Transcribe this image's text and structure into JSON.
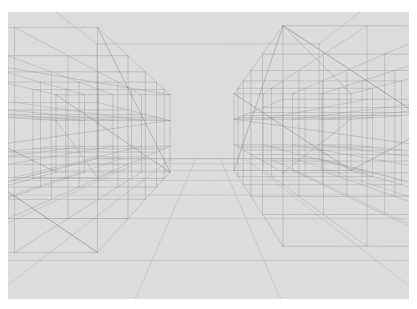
{
  "scene": {
    "title": "3D wireframe perspective interior",
    "type": "line-drawing",
    "canvas": {
      "width": 417,
      "height": 309
    },
    "paper": {
      "margin_left": 8,
      "margin_top": 12,
      "margin_right": 8,
      "margin_bottom": 10,
      "background_color": "#ffffff",
      "plate_color": "#dcdcdc"
    },
    "line_style": {
      "stroke_color": "#8d8d92",
      "stroke_color_faint": "#b2b2b6",
      "stroke_color_strong": "#75757b",
      "stroke_width_main": 0.6,
      "stroke_width_detail": 0.45
    },
    "camera": {
      "vanishing_point_x": 208,
      "vanishing_point_y": 130,
      "focal_length": 300,
      "eye_height": 1.55,
      "projection": "one-point-perspective"
    },
    "room": {
      "label": "enclosing room volume",
      "width": 12.0,
      "height": 6.2,
      "depth": 14.0,
      "back_wall_visible": true,
      "ceiling_visible": true,
      "floor_visible": true
    },
    "structures": [
      {
        "name": "left-block-lattice",
        "label": "Left cube lattice",
        "origin": [
          -5.6,
          0.0,
          1.6
        ],
        "cells": [
          4,
          3,
          5
        ],
        "cell_size": [
          1.05,
          0.95,
          1.45
        ]
      },
      {
        "name": "right-block-lattice",
        "label": "Right cube lattice",
        "origin": [
          1.0,
          0.0,
          1.8
        ],
        "cells": [
          4,
          3,
          5
        ],
        "cell_size": [
          1.12,
          0.98,
          1.5
        ]
      },
      {
        "name": "floor-grid",
        "label": "Floor grid plane",
        "rows": 7,
        "cols": 9
      }
    ]
  }
}
